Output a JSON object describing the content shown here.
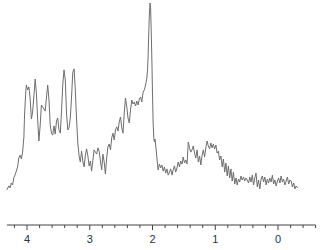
{
  "chart_data": {
    "type": "line",
    "title": "",
    "xlabel": "",
    "ylabel": "",
    "x_reversed": true,
    "xlim": [
      4.32,
      -0.6
    ],
    "ylim": [
      0,
      100
    ],
    "grid": false,
    "legend": "none",
    "x_major_ticks": [
      4,
      3,
      2,
      1,
      0
    ],
    "x_tick_labels": [
      "4",
      "3",
      "2",
      "1",
      "0"
    ],
    "x_minor_tick_step": 0.2,
    "series": [
      {
        "name": "spectrum",
        "color": "#6e6e6e",
        "points": [
          [
            4.32,
            5.1
          ],
          [
            4.29,
            7.1
          ],
          [
            4.27,
            6.1
          ],
          [
            4.25,
            8.6
          ],
          [
            4.23,
            7.6
          ],
          [
            4.21,
            11.1
          ],
          [
            4.18,
            13.6
          ],
          [
            4.15,
            16.7
          ],
          [
            4.13,
            21.2
          ],
          [
            4.11,
            22.7
          ],
          [
            4.09,
            20.7
          ],
          [
            4.07,
            24.2
          ],
          [
            4.05,
            31.8
          ],
          [
            4.04,
            42.4
          ],
          [
            4.02,
            54.0
          ],
          [
            4.01,
            58.1
          ],
          [
            3.99,
            55.6
          ],
          [
            3.97,
            57.1
          ],
          [
            3.95,
            51.5
          ],
          [
            3.93,
            40.9
          ],
          [
            3.91,
            44.4
          ],
          [
            3.89,
            52.5
          ],
          [
            3.87,
            61.1
          ],
          [
            3.85,
            54.0
          ],
          [
            3.83,
            40.4
          ],
          [
            3.81,
            29.8
          ],
          [
            3.79,
            37.9
          ],
          [
            3.77,
            48.0
          ],
          [
            3.75,
            47.0
          ],
          [
            3.73,
            46.0
          ],
          [
            3.71,
            44.9
          ],
          [
            3.69,
            52.0
          ],
          [
            3.67,
            58.1
          ],
          [
            3.65,
            50.5
          ],
          [
            3.63,
            37.9
          ],
          [
            3.61,
            33.8
          ],
          [
            3.59,
            32.8
          ],
          [
            3.57,
            37.4
          ],
          [
            3.55,
            33.3
          ],
          [
            3.53,
            39.9
          ],
          [
            3.51,
            41.4
          ],
          [
            3.49,
            35.4
          ],
          [
            3.47,
            33.8
          ],
          [
            3.45,
            44.9
          ],
          [
            3.43,
            58.6
          ],
          [
            3.41,
            65.7
          ],
          [
            3.39,
            60.6
          ],
          [
            3.37,
            43.9
          ],
          [
            3.35,
            35.4
          ],
          [
            3.33,
            36.4
          ],
          [
            3.31,
            41.4
          ],
          [
            3.29,
            52.5
          ],
          [
            3.27,
            64.6
          ],
          [
            3.25,
            66.2
          ],
          [
            3.23,
            55.6
          ],
          [
            3.21,
            40.4
          ],
          [
            3.19,
            28.8
          ],
          [
            3.17,
            22.2
          ],
          [
            3.15,
            19.2
          ],
          [
            3.13,
            24.7
          ],
          [
            3.11,
            19.7
          ],
          [
            3.09,
            16.7
          ],
          [
            3.07,
            22.7
          ],
          [
            3.05,
            25.8
          ],
          [
            3.03,
            22.2
          ],
          [
            3.01,
            17.2
          ],
          [
            2.99,
            19.7
          ],
          [
            2.97,
            14.6
          ],
          [
            2.95,
            20.2
          ],
          [
            2.93,
            25.3
          ],
          [
            2.91,
            24.2
          ],
          [
            2.89,
            23.2
          ],
          [
            2.87,
            26.3
          ],
          [
            2.85,
            24.7
          ],
          [
            2.83,
            19.7
          ],
          [
            2.81,
            15.2
          ],
          [
            2.79,
            23.2
          ],
          [
            2.77,
            19.2
          ],
          [
            2.75,
            13.1
          ],
          [
            2.73,
            21.2
          ],
          [
            2.71,
            26.8
          ],
          [
            2.69,
            28.3
          ],
          [
            2.67,
            25.3
          ],
          [
            2.65,
            31.3
          ],
          [
            2.63,
            33.8
          ],
          [
            2.61,
            30.3
          ],
          [
            2.59,
            35.4
          ],
          [
            2.57,
            36.9
          ],
          [
            2.55,
            34.8
          ],
          [
            2.53,
            39.4
          ],
          [
            2.51,
            41.9
          ],
          [
            2.49,
            36.4
          ],
          [
            2.47,
            33.8
          ],
          [
            2.45,
            44.4
          ],
          [
            2.43,
            51.5
          ],
          [
            2.41,
            47.0
          ],
          [
            2.39,
            41.4
          ],
          [
            2.37,
            38.9
          ],
          [
            2.35,
            45.5
          ],
          [
            2.33,
            50.5
          ],
          [
            2.31,
            48.5
          ],
          [
            2.29,
            49.5
          ],
          [
            2.27,
            47.5
          ],
          [
            2.25,
            50.0
          ],
          [
            2.23,
            48.0
          ],
          [
            2.21,
            51.0
          ],
          [
            2.19,
            52.0
          ],
          [
            2.17,
            49.5
          ],
          [
            2.15,
            54.5
          ],
          [
            2.13,
            55.6
          ],
          [
            2.11,
            58.1
          ],
          [
            2.09,
            61.6
          ],
          [
            2.08,
            65.7
          ],
          [
            2.07,
            72.7
          ],
          [
            2.06,
            83.3
          ],
          [
            2.05,
            93.9
          ],
          [
            2.04,
            99.5
          ],
          [
            2.03,
            97.0
          ],
          [
            2.02,
            85.9
          ],
          [
            2.01,
            70.2
          ],
          [
            2.0,
            53.5
          ],
          [
            1.99,
            39.4
          ],
          [
            1.98,
            31.3
          ],
          [
            1.97,
            29.3
          ],
          [
            1.96,
            30.8
          ],
          [
            1.95,
            28.3
          ],
          [
            1.93,
            21.2
          ],
          [
            1.91,
            15.2
          ],
          [
            1.89,
            18.2
          ],
          [
            1.87,
            16.2
          ],
          [
            1.85,
            17.7
          ],
          [
            1.83,
            14.6
          ],
          [
            1.81,
            16.7
          ],
          [
            1.79,
            13.6
          ],
          [
            1.77,
            15.7
          ],
          [
            1.75,
            12.6
          ],
          [
            1.73,
            14.1
          ],
          [
            1.71,
            15.7
          ],
          [
            1.69,
            12.6
          ],
          [
            1.67,
            15.2
          ],
          [
            1.65,
            17.2
          ],
          [
            1.63,
            14.1
          ],
          [
            1.61,
            16.2
          ],
          [
            1.59,
            19.2
          ],
          [
            1.57,
            16.7
          ],
          [
            1.55,
            19.7
          ],
          [
            1.53,
            18.2
          ],
          [
            1.51,
            21.7
          ],
          [
            1.49,
            18.7
          ],
          [
            1.47,
            20.2
          ],
          [
            1.45,
            18.2
          ],
          [
            1.43,
            29.3
          ],
          [
            1.41,
            26.3
          ],
          [
            1.39,
            24.2
          ],
          [
            1.37,
            25.3
          ],
          [
            1.35,
            27.3
          ],
          [
            1.33,
            23.7
          ],
          [
            1.31,
            21.2
          ],
          [
            1.29,
            25.3
          ],
          [
            1.27,
            19.2
          ],
          [
            1.25,
            22.2
          ],
          [
            1.23,
            17.7
          ],
          [
            1.21,
            22.7
          ],
          [
            1.19,
            25.3
          ],
          [
            1.17,
            21.7
          ],
          [
            1.15,
            26.3
          ],
          [
            1.13,
            29.8
          ],
          [
            1.11,
            27.3
          ],
          [
            1.09,
            25.8
          ],
          [
            1.07,
            28.8
          ],
          [
            1.05,
            26.3
          ],
          [
            1.03,
            28.3
          ],
          [
            1.01,
            25.8
          ],
          [
            0.99,
            27.8
          ],
          [
            0.97,
            23.7
          ],
          [
            0.95,
            24.7
          ],
          [
            0.93,
            20.2
          ],
          [
            0.91,
            22.2
          ],
          [
            0.89,
            16.7
          ],
          [
            0.87,
            20.7
          ],
          [
            0.85,
            14.1
          ],
          [
            0.83,
            18.7
          ],
          [
            0.81,
            12.1
          ],
          [
            0.79,
            17.2
          ],
          [
            0.77,
            11.1
          ],
          [
            0.75,
            15.7
          ],
          [
            0.73,
            9.6
          ],
          [
            0.71,
            14.1
          ],
          [
            0.69,
            8.1
          ],
          [
            0.67,
            11.1
          ],
          [
            0.65,
            7.6
          ],
          [
            0.63,
            10.6
          ],
          [
            0.61,
            9.1
          ],
          [
            0.59,
            12.1
          ],
          [
            0.57,
            10.1
          ],
          [
            0.55,
            11.6
          ],
          [
            0.53,
            9.6
          ],
          [
            0.51,
            11.1
          ],
          [
            0.49,
            10.1
          ],
          [
            0.47,
            8.6
          ],
          [
            0.45,
            11.6
          ],
          [
            0.43,
            9.1
          ],
          [
            0.41,
            12.6
          ],
          [
            0.39,
            7.6
          ],
          [
            0.37,
            11.1
          ],
          [
            0.35,
            13.6
          ],
          [
            0.33,
            6.6
          ],
          [
            0.31,
            10.1
          ],
          [
            0.29,
            5.6
          ],
          [
            0.27,
            10.6
          ],
          [
            0.25,
            12.1
          ],
          [
            0.23,
            9.1
          ],
          [
            0.21,
            11.6
          ],
          [
            0.19,
            7.6
          ],
          [
            0.17,
            10.6
          ],
          [
            0.15,
            8.6
          ],
          [
            0.13,
            11.1
          ],
          [
            0.11,
            9.1
          ],
          [
            0.09,
            12.6
          ],
          [
            0.07,
            8.1
          ],
          [
            0.05,
            10.1
          ],
          [
            0.03,
            7.1
          ],
          [
            0.01,
            9.6
          ],
          [
            -0.01,
            11.1
          ],
          [
            -0.03,
            8.6
          ],
          [
            -0.05,
            12.1
          ],
          [
            -0.07,
            9.1
          ],
          [
            -0.09,
            10.6
          ],
          [
            -0.11,
            7.6
          ],
          [
            -0.13,
            9.6
          ],
          [
            -0.15,
            11.6
          ],
          [
            -0.17,
            8.1
          ],
          [
            -0.19,
            10.1
          ],
          [
            -0.21,
            9.6
          ],
          [
            -0.23,
            6.6
          ],
          [
            -0.25,
            8.6
          ],
          [
            -0.27,
            5.6
          ],
          [
            -0.29,
            7.1
          ],
          [
            -0.31,
            6.1
          ]
        ]
      }
    ]
  }
}
